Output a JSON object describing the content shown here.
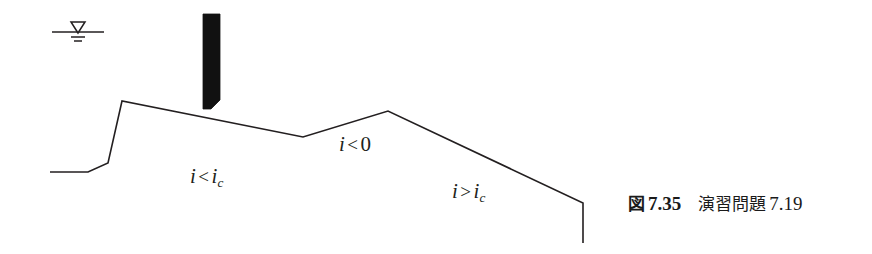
{
  "figure": {
    "canvas": {
      "width": 872,
      "height": 254,
      "background": "#ffffff"
    },
    "line_color": "#231f20",
    "fill_color": "#111111",
    "caption": {
      "tag": "図",
      "number": "7.35",
      "title": "演習問題",
      "title_number": "7.19",
      "full_text": "図 7.35  演習問題 7.19"
    },
    "water_table_symbol": {
      "name": "water-table-symbol",
      "surface_line": {
        "x1": 52,
        "y1": 32,
        "x2": 104,
        "y2": 32
      },
      "triangle": {
        "apex_x": 78,
        "apex_y": 32,
        "top_y": 22,
        "half_width": 7
      },
      "hatch_lines": [
        {
          "x1": 71,
          "y1": 37,
          "x2": 85,
          "y2": 37
        },
        {
          "x1": 74,
          "y1": 41,
          "x2": 82,
          "y2": 41
        }
      ]
    },
    "sluice_gate": {
      "name": "sluice-gate",
      "points": "203,14 220,14 220,100 211,109 203,109",
      "fill": "#111111"
    },
    "channel_bed_profile": {
      "name": "channel-bed-profile",
      "points": "50,172 88,172 108,163 122,101 303,137 388,111 583,203 583,243",
      "stroke_width": 1.6
    },
    "labels": [
      {
        "id": "label-i-lt-ic",
        "name": "label-i-less-than-ic",
        "variable": "i",
        "operator": "<",
        "target": "i",
        "subscript": "c",
        "text": "i < i_c",
        "x": 190,
        "y": 164
      },
      {
        "id": "label-i-lt-0",
        "name": "label-i-less-than-zero",
        "variable": "i",
        "operator": "<",
        "target": "0",
        "subscript": "",
        "text": "i < 0",
        "x": 339,
        "y": 132
      },
      {
        "id": "label-i-gt-ic",
        "name": "label-i-greater-than-ic",
        "variable": "i",
        "operator": ">",
        "target": "i",
        "subscript": "c",
        "text": "i > i_c",
        "x": 452,
        "y": 179
      }
    ]
  }
}
